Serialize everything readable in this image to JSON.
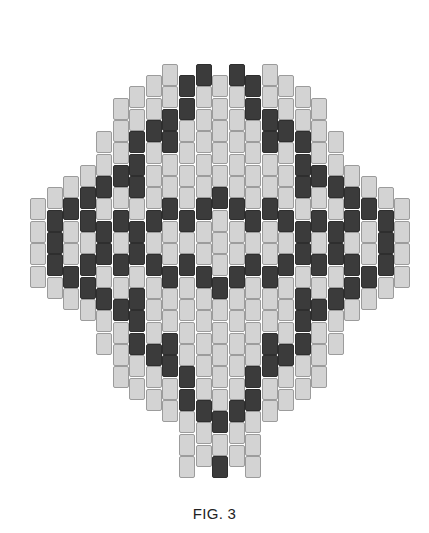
{
  "figure": {
    "caption": "FIG. 3",
    "colors": {
      "light_bead": "#d3d3d3",
      "dark_bead": "#3b3b3b",
      "bead_border": "#9c9c9c",
      "background": "#ffffff"
    }
  },
  "grid": {
    "origin_x": 30,
    "origin_y": 64,
    "column_pitch": 16.55,
    "half_bead_pitch": 11.2,
    "bead_width": 16,
    "bead_height": 22,
    "columns_left_half": [
      {
        "col": 0,
        "top": 12,
        "count": 4,
        "dark": []
      },
      {
        "col": 1,
        "top": 11,
        "count": 5,
        "dark": [
          13,
          15,
          17
        ]
      },
      {
        "col": 2,
        "top": 10,
        "count": 6,
        "dark": [
          12,
          18
        ]
      },
      {
        "col": 3,
        "top": 9,
        "count": 7,
        "dark": [
          11,
          13,
          17,
          19
        ]
      },
      {
        "col": 4,
        "top": 6,
        "count": 10,
        "dark": [
          10,
          14,
          16,
          20
        ]
      },
      {
        "col": 5,
        "top": 3,
        "count": 13,
        "dark": [
          9,
          13,
          17,
          21
        ]
      },
      {
        "col": 6,
        "top": 2,
        "count": 14,
        "dark": [
          6,
          8,
          10,
          14,
          16,
          20,
          22,
          24
        ]
      },
      {
        "col": 7,
        "top": 1,
        "count": 15,
        "dark": [
          5,
          13,
          17,
          25
        ]
      },
      {
        "col": 8,
        "top": 0,
        "count": 16,
        "dark": [
          4,
          6,
          12,
          18,
          24,
          26
        ]
      },
      {
        "col": 9,
        "top": 1,
        "count": 18,
        "dark": [
          1,
          3,
          13,
          17,
          27,
          29
        ]
      },
      {
        "col": 10,
        "top": 0,
        "count": 18,
        "dark": [
          0,
          12,
          18,
          30
        ]
      },
      {
        "col": 11,
        "top": 1,
        "count": 18,
        "dark": [
          11,
          19,
          31,
          35
        ]
      }
    ],
    "total_columns": 23,
    "mirror_about_column": 11
  }
}
